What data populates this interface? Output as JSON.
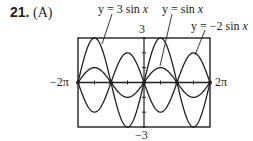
{
  "problem": {
    "number": "21.",
    "part": "(A)"
  },
  "chart_data": {
    "type": "line",
    "title": "",
    "xlabel": "",
    "ylabel": "",
    "xlim": [
      -6.2832,
      6.2832
    ],
    "ylim": [
      -3,
      3
    ],
    "x_tick_labels": {
      "min": "−2π",
      "max": "2π"
    },
    "y_tick_labels": {
      "max": "3",
      "min": "−3"
    },
    "grid": false,
    "series": [
      {
        "name": "y = 3 sin x",
        "function": "3*sin(x)",
        "amplitude": 3
      },
      {
        "name": "y = sin x",
        "function": "sin(x)",
        "amplitude": 1
      },
      {
        "name": "y = −2 sin x",
        "function": "-2*sin(x)",
        "amplitude": -2
      }
    ],
    "annotations": [
      "y = 3 sin x",
      "y = sin x",
      "y = −2 sin x"
    ]
  },
  "labels": {
    "s1_prefix": "y = 3 sin ",
    "s1_var": "x",
    "s2_prefix": "y = sin ",
    "s2_var": "x",
    "s3_prefix": "y = −2 sin ",
    "s3_var": "x",
    "ymax": "3",
    "ymin": "−3",
    "xmin": "−2π",
    "xmax": "2π"
  }
}
